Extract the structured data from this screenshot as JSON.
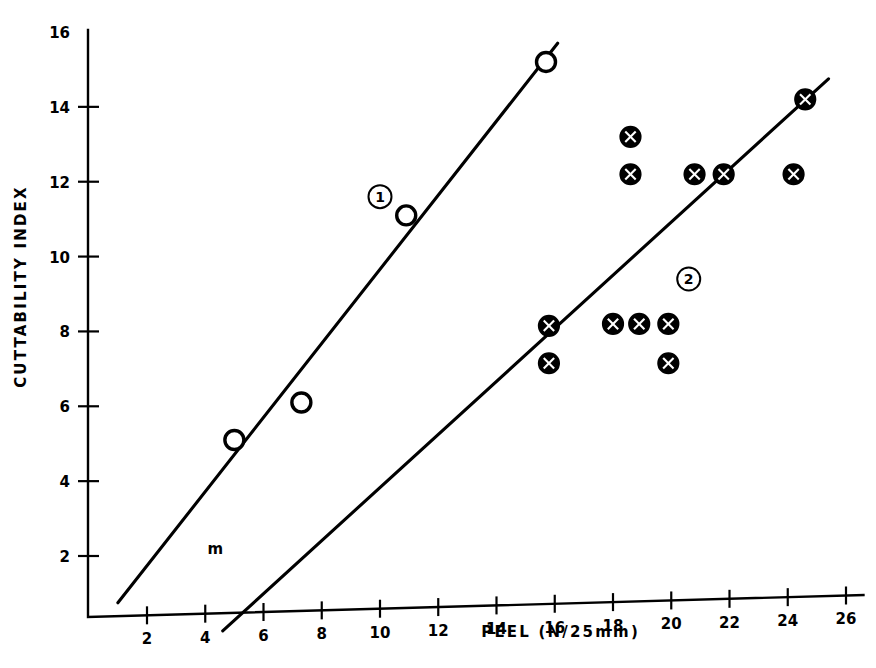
{
  "chart_data": {
    "type": "scatter",
    "title": "",
    "xlabel": "PEEL (N/25mm)",
    "ylabel": "CUTTABILITY INDEX",
    "xlim": [
      0,
      26.8
    ],
    "ylim": [
      0,
      16.6
    ],
    "xticks": [
      2,
      4,
      6,
      8,
      10,
      12,
      14,
      16,
      18,
      20,
      22,
      24,
      26
    ],
    "yticks": [
      2,
      4,
      6,
      8,
      10,
      12,
      14,
      16
    ],
    "grid": false,
    "legend_position": "inline-annotations",
    "series": [
      {
        "name": "1",
        "marker": "open-circle",
        "annotation": "1",
        "annotation_point": [
          10.0,
          11.6
        ],
        "points": [
          {
            "x": 5.0,
            "y": 5.1
          },
          {
            "x": 7.3,
            "y": 6.1
          },
          {
            "x": 10.9,
            "y": 11.1
          },
          {
            "x": 15.7,
            "y": 15.2
          }
        ],
        "fit_line": {
          "x1": 1.0,
          "y1": 0.75,
          "x2": 16.1,
          "y2": 15.7
        }
      },
      {
        "name": "2",
        "marker": "crossed-circle",
        "annotation": "2",
        "annotation_point": [
          20.6,
          9.4
        ],
        "points": [
          {
            "x": 15.8,
            "y": 8.15
          },
          {
            "x": 15.8,
            "y": 7.15
          },
          {
            "x": 18.0,
            "y": 8.2
          },
          {
            "x": 18.6,
            "y": 13.2
          },
          {
            "x": 18.6,
            "y": 12.2
          },
          {
            "x": 18.9,
            "y": 8.2
          },
          {
            "x": 19.9,
            "y": 8.2
          },
          {
            "x": 19.9,
            "y": 7.15
          },
          {
            "x": 20.8,
            "y": 12.2
          },
          {
            "x": 21.8,
            "y": 12.2
          },
          {
            "x": 24.2,
            "y": 12.2
          },
          {
            "x": 24.6,
            "y": 14.2
          }
        ],
        "fit_line": {
          "x1": 4.6,
          "y1": 0.0,
          "x2": 25.4,
          "y2": 14.75
        }
      }
    ],
    "annotations": [
      {
        "text": "m",
        "x": 4.35,
        "y": 2.05,
        "kind": "stray-mark"
      }
    ]
  }
}
